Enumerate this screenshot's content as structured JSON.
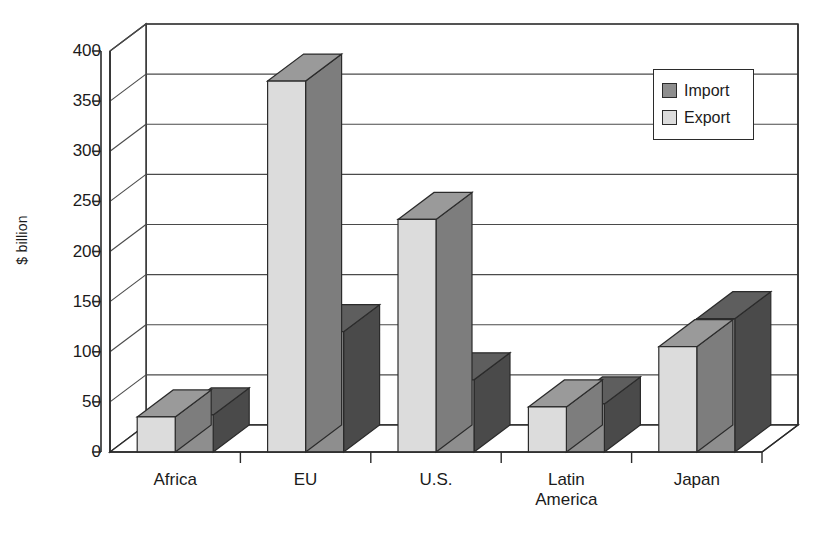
{
  "chart_data": {
    "type": "bar",
    "title": "",
    "subtitle": "",
    "xlabel": "",
    "ylabel": "$ billion",
    "categories": [
      "Africa",
      "EU",
      "U.S.",
      "Latin\nAmerica",
      "Japan"
    ],
    "ylim": [
      0,
      400
    ],
    "yticks": [
      0,
      50,
      100,
      150,
      200,
      250,
      300,
      350,
      400
    ],
    "ytick_labels": [
      "0",
      "50",
      "100",
      "150",
      "200",
      "250",
      "300",
      "350",
      "400"
    ],
    "grid": true,
    "grid_axis": "y",
    "legend_position": "top-right",
    "style": "3d-column",
    "series": [
      {
        "name": "Import",
        "color": "#888888",
        "values": [
          37,
          120,
          72,
          48,
          133
        ]
      },
      {
        "name": "Export",
        "color": "#d9d9d9",
        "values": [
          35,
          370,
          232,
          45,
          105
        ]
      }
    ],
    "series_draw_order": [
      "Export",
      "Import"
    ],
    "annotations": []
  },
  "legend": {
    "items": [
      {
        "label": "Import",
        "swatch_color": "#888888",
        "icon": "legend-swatch-icon"
      },
      {
        "label": "Export",
        "swatch_color": "#d9d9d9",
        "icon": "legend-swatch-icon"
      }
    ]
  },
  "axis": {
    "y_title": "$ billion",
    "y_labels": [
      "400",
      "350",
      "300",
      "250",
      "200",
      "150",
      "100",
      "50",
      "0"
    ],
    "x_labels": [
      "Africa",
      "EU",
      "U.S.",
      "Latin\nAmerica",
      "Japan"
    ]
  },
  "colors": {
    "import_front": "#8e8e8e",
    "import_top": "#5e5e5e",
    "import_side": "#4a4a4a",
    "export_front": "#dcdcdc",
    "export_top": "#9a9a9a",
    "export_side": "#7d7d7d",
    "line": "#2b2b2b",
    "grid": "#4a4a4a",
    "background": "#ffffff"
  }
}
